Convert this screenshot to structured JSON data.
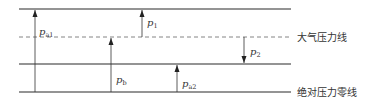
{
  "colors": {
    "line": "#2a2a2a",
    "dashed": "#777777",
    "arrow": "#333333",
    "text": "#333333",
    "background": "#ffffff"
  },
  "lines": {
    "top": {
      "y": 9,
      "style": "solid"
    },
    "atmospheric": {
      "y": 37,
      "style": "dashed",
      "label": "大气压力线"
    },
    "middle": {
      "y": 64,
      "style": "solid"
    },
    "absolute_zero": {
      "y": 92,
      "style": "solid",
      "label": "绝对压力零线"
    }
  },
  "arrows": [
    {
      "id": "pa1",
      "symbol": "p",
      "subscript": "a1",
      "x": 35,
      "from_y": 92,
      "to_y": 9,
      "direction": "up"
    },
    {
      "id": "p1",
      "symbol": "p",
      "subscript": "1",
      "x": 142,
      "from_y": 37,
      "to_y": 9,
      "direction": "up"
    },
    {
      "id": "pb",
      "symbol": "p",
      "subscript": "b",
      "x": 111,
      "from_y": 92,
      "to_y": 37,
      "direction": "up"
    },
    {
      "id": "p2",
      "symbol": "p",
      "subscript": "2",
      "x": 244,
      "from_y": 37,
      "to_y": 64,
      "direction": "down"
    },
    {
      "id": "pa2",
      "symbol": "p",
      "subscript": "a2",
      "x": 177,
      "from_y": 92,
      "to_y": 64,
      "direction": "up"
    }
  ],
  "labels": {
    "pa1": {
      "symbol": "p",
      "sub": "a1"
    },
    "p1": {
      "symbol": "p",
      "sub": "1"
    },
    "pb": {
      "symbol": "p",
      "sub": "b"
    },
    "p2": {
      "symbol": "p",
      "sub": "2"
    },
    "pa2": {
      "symbol": "p",
      "sub": "a2"
    },
    "atmospheric_line": "大气压力线",
    "absolute_zero_line": "绝对压力零线"
  }
}
